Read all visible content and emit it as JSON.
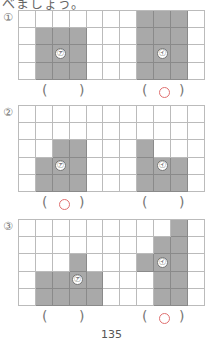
{
  "header_text": "べましょう。",
  "problems": [
    {
      "label": "①",
      "top": 10,
      "rows": 4,
      "cols": 11,
      "shapes": [
        {
          "marker": "㋐",
          "cells": [
            [
              1,
              1
            ],
            [
              1,
              2
            ],
            [
              1,
              3
            ],
            [
              2,
              1
            ],
            [
              2,
              2
            ],
            [
              2,
              3
            ],
            [
              3,
              1
            ],
            [
              3,
              2
            ],
            [
              3,
              3
            ]
          ],
          "marker_cell": [
            2,
            2
          ],
          "answer": ""
        },
        {
          "marker": "㋑",
          "cells": [
            [
              0,
              7
            ],
            [
              0,
              8
            ],
            [
              0,
              9
            ],
            [
              1,
              7
            ],
            [
              1,
              8
            ],
            [
              1,
              9
            ],
            [
              2,
              7
            ],
            [
              2,
              8
            ],
            [
              2,
              9
            ],
            [
              3,
              7
            ],
            [
              3,
              8
            ],
            [
              3,
              9
            ]
          ],
          "marker_cell": [
            2,
            8
          ],
          "answer": "○"
        }
      ]
    },
    {
      "label": "②",
      "top": 105,
      "rows": 5,
      "cols": 11,
      "shapes": [
        {
          "marker": "㋐",
          "cells": [
            [
              2,
              2
            ],
            [
              2,
              3
            ],
            [
              3,
              1
            ],
            [
              3,
              2
            ],
            [
              3,
              3
            ],
            [
              4,
              1
            ],
            [
              4,
              2
            ],
            [
              4,
              3
            ]
          ],
          "marker_cell": [
            3,
            2
          ],
          "answer": "○"
        },
        {
          "marker": "㋑",
          "cells": [
            [
              2,
              7
            ],
            [
              3,
              7
            ],
            [
              3,
              8
            ],
            [
              3,
              9
            ],
            [
              4,
              7
            ],
            [
              4,
              8
            ],
            [
              4,
              9
            ]
          ],
          "marker_cell": [
            3,
            8
          ],
          "answer": ""
        }
      ]
    },
    {
      "label": "③",
      "top": 219,
      "rows": 5,
      "cols": 11,
      "shapes": [
        {
          "marker": "㋐",
          "cells": [
            [
              2,
              3
            ],
            [
              3,
              1
            ],
            [
              3,
              2
            ],
            [
              3,
              3
            ],
            [
              3,
              4
            ],
            [
              4,
              1
            ],
            [
              4,
              2
            ],
            [
              4,
              3
            ],
            [
              4,
              4
            ]
          ],
          "marker_cell": [
            3,
            3
          ],
          "answer": ""
        },
        {
          "marker": "㋑",
          "cells": [
            [
              0,
              9
            ],
            [
              1,
              8
            ],
            [
              1,
              9
            ],
            [
              2,
              7
            ],
            [
              2,
              8
            ],
            [
              2,
              9
            ],
            [
              3,
              8
            ],
            [
              3,
              9
            ],
            [
              4,
              8
            ],
            [
              4,
              9
            ]
          ],
          "marker_cell": [
            2,
            8
          ],
          "answer": "○"
        }
      ]
    }
  ],
  "paren_open": "(",
  "paren_close": ")",
  "page_number": "135"
}
